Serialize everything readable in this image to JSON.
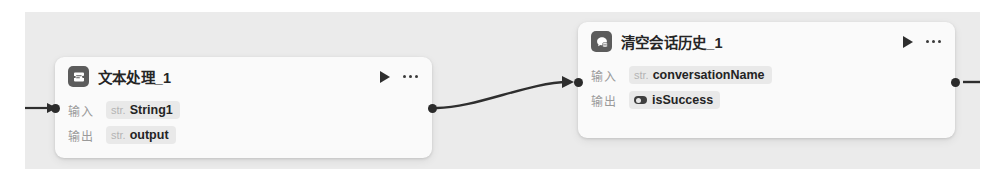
{
  "canvas": {
    "background_color": "#ebebeb",
    "page_background_color": "#ffffff"
  },
  "nodes": [
    {
      "id": "text-processing",
      "title": "文本处理_1",
      "icon": "text-processing-icon",
      "play_label": "▶",
      "more_label": "•••",
      "rows": [
        {
          "label": "输入",
          "type": "str.",
          "name": "String1",
          "kind": "string"
        },
        {
          "label": "输出",
          "type": "str.",
          "name": "output",
          "kind": "string"
        }
      ]
    },
    {
      "id": "clear-conversation-history",
      "title": "清空会话历史_1",
      "icon": "clear-conversation-icon",
      "play_label": "▶",
      "more_label": "•••",
      "rows": [
        {
          "label": "输入",
          "type": "str.",
          "name": "conversationName",
          "kind": "string"
        },
        {
          "label": "输出",
          "type": "",
          "name": "isSuccess",
          "kind": "boolean"
        }
      ]
    }
  ],
  "edges": [
    {
      "from": "incoming",
      "to": "text-processing.input",
      "arrow": true
    },
    {
      "from": "text-processing.output",
      "to": "clear-conversation-history.input",
      "arrow": true
    },
    {
      "from": "clear-conversation-history.output",
      "to": "outgoing",
      "arrow": false
    }
  ],
  "colors": {
    "node_background": "#fafafa",
    "chip_background": "#e9e9e9",
    "port_dot": "#2b2b2b",
    "edge_stroke": "#2e2e2e",
    "title_text": "#252525",
    "label_text": "#9a9a9a",
    "type_text": "#b4b4b4"
  }
}
